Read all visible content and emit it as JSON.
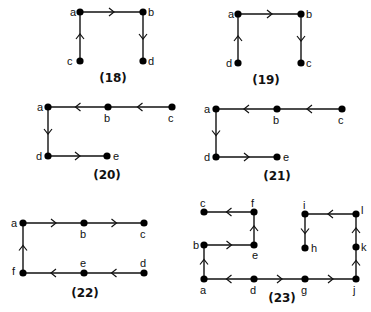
{
  "figures": [
    {
      "id": "18",
      "caption": "(18)",
      "caption_pos": [
        113,
        82
      ],
      "nodes": [
        {
          "name": "a",
          "x": 80,
          "y": 12,
          "lx": 70,
          "ly": 16
        },
        {
          "name": "b",
          "x": 143,
          "y": 12,
          "lx": 148,
          "ly": 16
        },
        {
          "name": "c",
          "x": 80,
          "y": 61,
          "lx": 67,
          "ly": 65
        },
        {
          "name": "d",
          "x": 143,
          "y": 61,
          "lx": 148,
          "ly": 65
        }
      ],
      "edges": [
        {
          "from": "c",
          "to": "a"
        },
        {
          "from": "a",
          "to": "b"
        },
        {
          "from": "b",
          "to": "d"
        }
      ]
    },
    {
      "id": "19",
      "caption": "(19)",
      "caption_pos": [
        266,
        84
      ],
      "nodes": [
        {
          "name": "a",
          "x": 238,
          "y": 14,
          "lx": 228,
          "ly": 18
        },
        {
          "name": "b",
          "x": 301,
          "y": 14,
          "lx": 306,
          "ly": 18
        },
        {
          "name": "c",
          "x": 301,
          "y": 63,
          "lx": 306,
          "ly": 67
        },
        {
          "name": "d",
          "x": 238,
          "y": 63,
          "lx": 226,
          "ly": 67
        }
      ],
      "edges": [
        {
          "from": "d",
          "to": "a"
        },
        {
          "from": "a",
          "to": "b"
        },
        {
          "from": "b",
          "to": "c"
        }
      ]
    },
    {
      "id": "20",
      "caption": "(20)",
      "caption_pos": [
        107,
        179
      ],
      "nodes": [
        {
          "name": "a",
          "x": 48,
          "y": 107,
          "lx": 37,
          "ly": 111
        },
        {
          "name": "b",
          "x": 108,
          "y": 107,
          "lx": 104,
          "ly": 122
        },
        {
          "name": "c",
          "x": 172,
          "y": 107,
          "lx": 168,
          "ly": 122
        },
        {
          "name": "d",
          "x": 48,
          "y": 156,
          "lx": 36,
          "ly": 160
        },
        {
          "name": "e",
          "x": 107,
          "y": 156,
          "lx": 113,
          "ly": 160
        }
      ],
      "edges": [
        {
          "from": "c",
          "to": "b"
        },
        {
          "from": "b",
          "to": "a"
        },
        {
          "from": "a",
          "to": "d"
        },
        {
          "from": "d",
          "to": "e"
        }
      ]
    },
    {
      "id": "21",
      "caption": "(21)",
      "caption_pos": [
        277,
        180
      ],
      "nodes": [
        {
          "name": "a",
          "x": 216,
          "y": 109,
          "lx": 204,
          "ly": 113
        },
        {
          "name": "b",
          "x": 277,
          "y": 109,
          "lx": 273,
          "ly": 124
        },
        {
          "name": "c",
          "x": 342,
          "y": 109,
          "lx": 338,
          "ly": 124
        },
        {
          "name": "d",
          "x": 216,
          "y": 157,
          "lx": 204,
          "ly": 161
        },
        {
          "name": "e",
          "x": 277,
          "y": 157,
          "lx": 283,
          "ly": 161
        }
      ],
      "edges": [
        {
          "from": "c",
          "to": "b"
        },
        {
          "from": "b",
          "to": "a"
        },
        {
          "from": "a",
          "to": "d"
        },
        {
          "from": "d",
          "to": "e"
        }
      ]
    },
    {
      "id": "22",
      "caption": "(22)",
      "caption_pos": [
        85,
        297
      ],
      "nodes": [
        {
          "name": "a",
          "x": 23,
          "y": 223,
          "lx": 11,
          "ly": 227
        },
        {
          "name": "b",
          "x": 84,
          "y": 223,
          "lx": 80,
          "ly": 238
        },
        {
          "name": "c",
          "x": 144,
          "y": 223,
          "lx": 140,
          "ly": 238
        },
        {
          "name": "d",
          "x": 144,
          "y": 273,
          "lx": 140,
          "ly": 267
        },
        {
          "name": "e",
          "x": 84,
          "y": 273,
          "lx": 80,
          "ly": 267
        },
        {
          "name": "f",
          "x": 23,
          "y": 273,
          "lx": 12,
          "ly": 275
        }
      ],
      "edges": [
        {
          "from": "f",
          "to": "a"
        },
        {
          "from": "a",
          "to": "b"
        },
        {
          "from": "b",
          "to": "c"
        },
        {
          "from": "d",
          "to": "e"
        },
        {
          "from": "e",
          "to": "f"
        }
      ]
    },
    {
      "id": "23",
      "caption": "(23)",
      "caption_pos": [
        282,
        302
      ],
      "nodes": [
        {
          "name": "a",
          "x": 204,
          "y": 279,
          "lx": 200,
          "ly": 294
        },
        {
          "name": "b",
          "x": 204,
          "y": 245,
          "lx": 193,
          "ly": 249
        },
        {
          "name": "c",
          "x": 204,
          "y": 212,
          "lx": 200,
          "ly": 207
        },
        {
          "name": "d",
          "x": 254,
          "y": 279,
          "lx": 250,
          "ly": 294
        },
        {
          "name": "e",
          "x": 254,
          "y": 245,
          "lx": 252,
          "ly": 259
        },
        {
          "name": "f",
          "x": 254,
          "y": 212,
          "lx": 251,
          "ly": 207
        },
        {
          "name": "g",
          "x": 305,
          "y": 279,
          "lx": 301,
          "ly": 294
        },
        {
          "name": "h",
          "x": 305,
          "y": 248,
          "lx": 311,
          "ly": 252
        },
        {
          "name": "i",
          "x": 305,
          "y": 214,
          "lx": 303,
          "ly": 209
        },
        {
          "name": "j",
          "x": 356,
          "y": 279,
          "lx": 353,
          "ly": 294
        },
        {
          "name": "k",
          "x": 356,
          "y": 247,
          "lx": 361,
          "ly": 251
        },
        {
          "name": "l",
          "x": 356,
          "y": 214,
          "lx": 361,
          "ly": 214
        }
      ],
      "edges": [
        {
          "from": "d",
          "to": "a"
        },
        {
          "from": "a",
          "to": "b"
        },
        {
          "from": "b",
          "to": "e"
        },
        {
          "from": "e",
          "to": "f"
        },
        {
          "from": "f",
          "to": "c"
        },
        {
          "from": "d",
          "to": "g"
        },
        {
          "from": "g",
          "to": "j"
        },
        {
          "from": "j",
          "to": "k"
        },
        {
          "from": "k",
          "to": "l"
        },
        {
          "from": "l",
          "to": "i"
        },
        {
          "from": "i",
          "to": "h"
        }
      ]
    }
  ],
  "style": {
    "ink_color": "#111111",
    "background": "#ffffff"
  }
}
